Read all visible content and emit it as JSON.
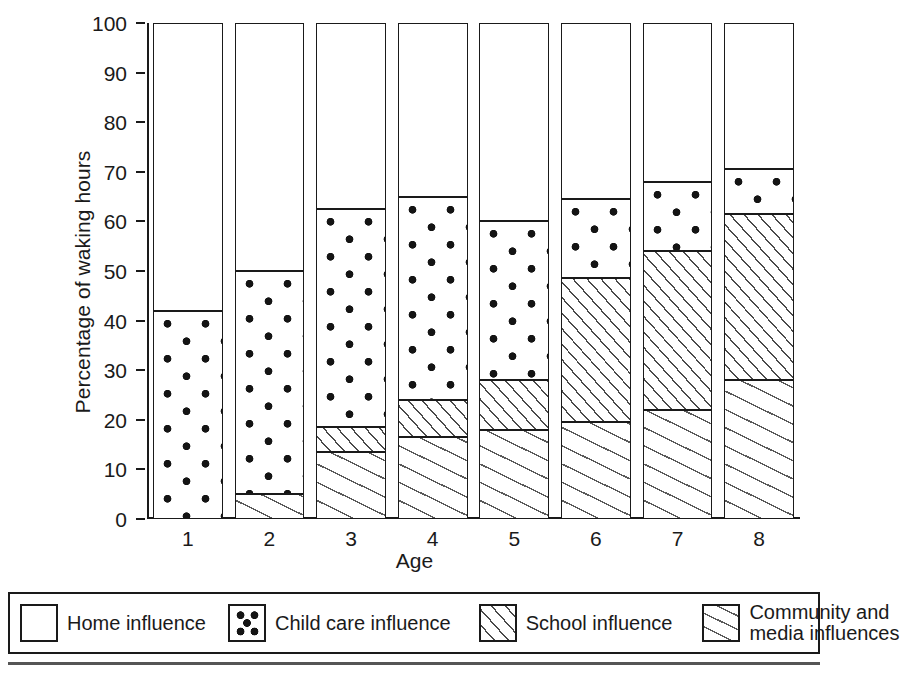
{
  "chart_data": {
    "type": "bar",
    "subtype": "stacked-bar",
    "title": "",
    "xlabel": "Age",
    "ylabel": "Percentage of waking hours",
    "categories": [
      "1",
      "2",
      "3",
      "4",
      "5",
      "6",
      "7",
      "8"
    ],
    "ylim": [
      0,
      100
    ],
    "yticks": [
      0,
      10,
      20,
      30,
      40,
      50,
      60,
      70,
      80,
      90,
      100
    ],
    "ytick_labels": [
      "0",
      "10",
      "20",
      "30",
      "40",
      "50",
      "60",
      "70",
      "80",
      "90",
      "100"
    ],
    "grid": false,
    "legend_position": "below-plot",
    "stack_order_bottom_to_top": [
      "Community and media influences",
      "School influence",
      "Child care influence",
      "Home influence"
    ],
    "series": [
      {
        "name": "Community and media influences",
        "key": "community",
        "values": [
          0,
          5,
          13.5,
          16.5,
          18,
          19.5,
          22,
          28
        ]
      },
      {
        "name": "School influence",
        "key": "school",
        "values": [
          0,
          0,
          5,
          7.5,
          10,
          29,
          32,
          33.5
        ]
      },
      {
        "name": "Child care influence",
        "key": "childcare",
        "values": [
          42,
          45,
          44,
          41,
          32,
          16,
          14,
          9
        ]
      },
      {
        "name": "Home influence",
        "key": "home",
        "values": [
          58,
          50,
          37.5,
          35,
          40,
          35.5,
          32,
          29.5
        ]
      }
    ],
    "cumulative_tops": {
      "community": [
        0,
        5,
        13.5,
        16.5,
        18,
        19.5,
        22,
        28
      ],
      "school": [
        0,
        5,
        18.5,
        24,
        28,
        48.5,
        54,
        61.5
      ],
      "childcare": [
        42,
        50,
        62.5,
        65,
        60,
        64.5,
        68,
        70.5
      ],
      "home": [
        100,
        100,
        100,
        100,
        100,
        100,
        100,
        100
      ]
    }
  },
  "axes": {
    "y_title": "Percentage of waking hours",
    "x_title": "Age"
  },
  "legend": {
    "entries": [
      {
        "label": "Home influence",
        "pattern": "blank-white",
        "key": "home"
      },
      {
        "label": "Child care influence",
        "pattern": "dots",
        "key": "childcare"
      },
      {
        "label": "School influence",
        "pattern": "dense-diagonal-hatch",
        "key": "school"
      },
      {
        "label": "Community and\nmedia influences",
        "pattern": "wide-diagonal-hatch",
        "key": "community"
      }
    ]
  },
  "colors": {
    "ink": "#1a1a1a",
    "fill": "#ffffff",
    "hatch": "#4a4a4a",
    "dot": "#141414"
  }
}
